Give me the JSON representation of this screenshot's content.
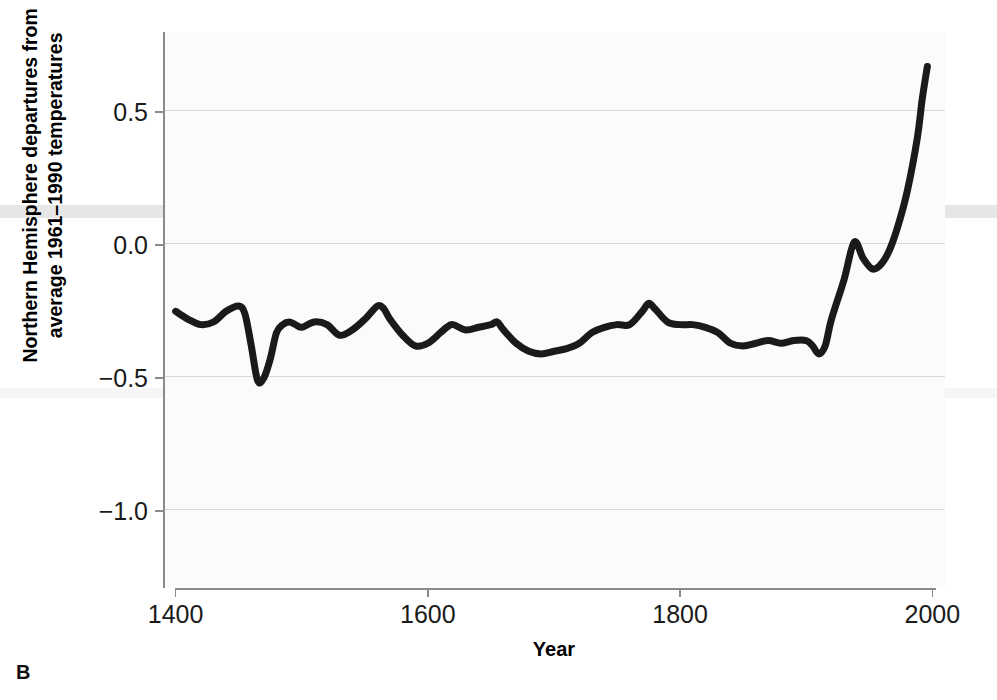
{
  "panel": {
    "label": "B"
  },
  "axes": {
    "x": {
      "title": "Year",
      "ticks": [
        1400,
        1600,
        1800,
        2000
      ],
      "ticklabels": [
        "1400",
        "1600",
        "1800",
        "2000"
      ],
      "min": 1390,
      "max": 2010
    },
    "y": {
      "title_line1": "Northern Hemisphere departures from",
      "title_line2": "average 1961–1990 temperatures",
      "ticks": [
        0.5,
        0.0,
        -0.5,
        -1.0
      ],
      "ticklabels": [
        "0.5",
        "0.0",
        "−0.5",
        "−1.0"
      ],
      "min": -1.29,
      "max": 0.8
    }
  },
  "style": {
    "line_color": "#1a1a1a",
    "line_width": 7,
    "grid_color": "#d8d8d8",
    "axis_color": "#8b8b8b",
    "plot_background": "#fbfbfb"
  },
  "chart_data": {
    "type": "line",
    "title": "",
    "xlabel": "Year",
    "ylabel": "Northern Hemisphere departures from average 1961–1990 temperatures",
    "xlim": [
      1390,
      2010
    ],
    "ylim": [
      -1.29,
      0.8
    ],
    "grid": true,
    "legend": "none",
    "units": "°C",
    "series": [
      {
        "name": "Northern Hemisphere temperature anomaly",
        "x": [
          1400,
          1410,
          1420,
          1430,
          1440,
          1450,
          1455,
          1460,
          1465,
          1470,
          1475,
          1480,
          1485,
          1490,
          1495,
          1500,
          1510,
          1520,
          1530,
          1540,
          1550,
          1560,
          1565,
          1570,
          1580,
          1590,
          1600,
          1610,
          1615,
          1620,
          1630,
          1640,
          1650,
          1655,
          1660,
          1670,
          1680,
          1690,
          1700,
          1710,
          1720,
          1730,
          1740,
          1750,
          1760,
          1770,
          1775,
          1780,
          1790,
          1800,
          1810,
          1820,
          1830,
          1840,
          1850,
          1860,
          1870,
          1880,
          1890,
          1900,
          1905,
          1910,
          1915,
          1920,
          1930,
          1938,
          1945,
          1952,
          1958,
          1965,
          1972,
          1980,
          1988,
          1992,
          1996
        ],
        "y": [
          -0.25,
          -0.28,
          -0.3,
          -0.29,
          -0.25,
          -0.23,
          -0.26,
          -0.38,
          -0.51,
          -0.5,
          -0.43,
          -0.33,
          -0.3,
          -0.29,
          -0.3,
          -0.31,
          -0.29,
          -0.3,
          -0.34,
          -0.32,
          -0.28,
          -0.23,
          -0.24,
          -0.28,
          -0.34,
          -0.38,
          -0.37,
          -0.33,
          -0.31,
          -0.3,
          -0.32,
          -0.31,
          -0.3,
          -0.29,
          -0.32,
          -0.37,
          -0.4,
          -0.41,
          -0.4,
          -0.39,
          -0.37,
          -0.33,
          -0.31,
          -0.3,
          -0.3,
          -0.25,
          -0.22,
          -0.24,
          -0.29,
          -0.3,
          -0.3,
          -0.31,
          -0.33,
          -0.37,
          -0.38,
          -0.37,
          -0.36,
          -0.37,
          -0.36,
          -0.36,
          -0.38,
          -0.41,
          -0.38,
          -0.28,
          -0.13,
          0.01,
          -0.05,
          -0.09,
          -0.08,
          -0.03,
          0.06,
          0.2,
          0.4,
          0.55,
          0.67
        ]
      }
    ]
  }
}
